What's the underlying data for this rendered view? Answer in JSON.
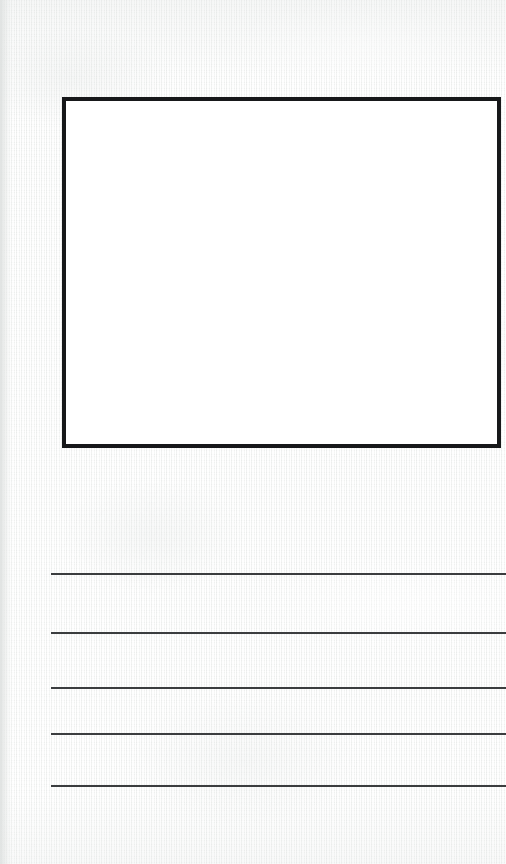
{
  "page": {
    "kind": "draw-and-write-worksheet",
    "width": 506,
    "height": 864,
    "paper_color": "#f2f3f2",
    "paper_texture": "fibrous off-white scanned paper",
    "left_margin_shade_color": "#dbdedd"
  },
  "drawing_frame": {
    "label": "",
    "content": "",
    "fill_color": "#ffffff",
    "border_color": "#17181a",
    "border_width_px": 4,
    "x": 62,
    "y": 97,
    "width": 439,
    "height": 351
  },
  "writing_area": {
    "line_color": "#3b3d3f",
    "line_thickness_px": 2,
    "line_start_x": 51,
    "line_end_x": 506,
    "lines": [
      {
        "index": 1,
        "y": 573,
        "text": ""
      },
      {
        "index": 2,
        "y": 632,
        "text": ""
      },
      {
        "index": 3,
        "y": 687,
        "text": ""
      },
      {
        "index": 4,
        "y": 733,
        "text": ""
      },
      {
        "index": 5,
        "y": 785,
        "text": ""
      }
    ]
  }
}
